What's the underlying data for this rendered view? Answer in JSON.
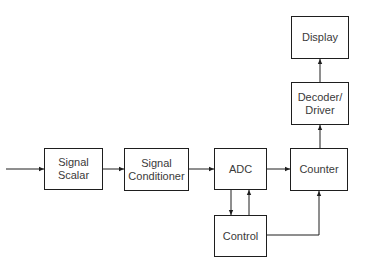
{
  "diagram": {
    "type": "block-diagram",
    "blocks": [
      {
        "id": "signal_scalar",
        "label": "Signal\nScalar"
      },
      {
        "id": "signal_conditioner",
        "label": "Signal\nConditioner"
      },
      {
        "id": "adc",
        "label": "ADC"
      },
      {
        "id": "counter",
        "label": "Counter"
      },
      {
        "id": "control",
        "label": "Control"
      },
      {
        "id": "decoder_driver",
        "label": "Decoder/\nDriver"
      },
      {
        "id": "display",
        "label": "Display"
      }
    ],
    "connections": [
      {
        "from": "input",
        "to": "signal_scalar"
      },
      {
        "from": "signal_scalar",
        "to": "signal_conditioner"
      },
      {
        "from": "signal_conditioner",
        "to": "adc"
      },
      {
        "from": "adc",
        "to": "counter"
      },
      {
        "from": "adc",
        "to": "control"
      },
      {
        "from": "control",
        "to": "adc"
      },
      {
        "from": "control",
        "to": "counter"
      },
      {
        "from": "counter",
        "to": "decoder_driver"
      },
      {
        "from": "decoder_driver",
        "to": "display"
      }
    ],
    "colors": {
      "line": "#1e1e1e",
      "text": "#3a3a3a",
      "background": "#ffffff"
    }
  }
}
